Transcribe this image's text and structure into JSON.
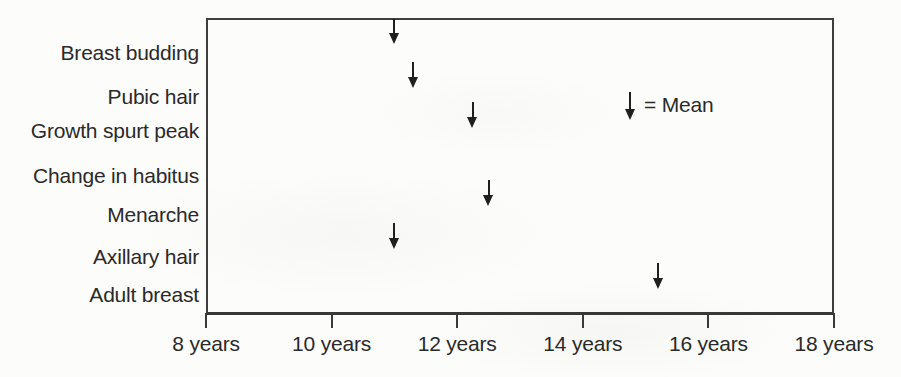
{
  "chart_data": {
    "type": "scatter",
    "subtype": "milestone-timeline",
    "marker": "down-arrow",
    "title": "",
    "xlabel": "",
    "ylabel": "",
    "x_unit": "years",
    "xlim": [
      8,
      18
    ],
    "grid": false,
    "x_tick_values": [
      8,
      10,
      12,
      14,
      16,
      18
    ],
    "x_tick_labels": [
      "8 years",
      "10 years",
      "12 years",
      "14 years",
      "16 years",
      "18 years"
    ],
    "categories": [
      "Breast budding",
      "Pubic hair",
      "Growth spurt peak",
      "Change in habitus",
      "Menarche",
      "Axillary hair",
      "Adult breast"
    ],
    "mean_age_years": [
      11.0,
      11.3,
      12.25,
      null,
      12.5,
      11.0,
      15.2
    ],
    "legend": {
      "symbol": "↓",
      "text": "= Mean",
      "position": "inside-upper-right"
    },
    "colors": {
      "line": "#3f3f3f",
      "arrow": "#1f1f1f",
      "text": "#2a2a2a",
      "background": "#fcfcfa"
    }
  }
}
